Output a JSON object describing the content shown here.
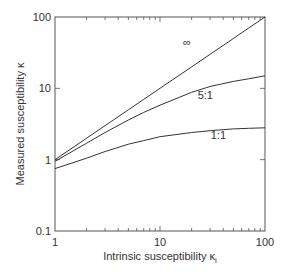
{
  "chart_data": {
    "type": "line",
    "title": "",
    "xlabel": "Intrinsic susceptibility κ",
    "xlabel_sub": "i",
    "ylabel": "Measured susceptibility κ",
    "xscale": "log",
    "yscale": "log",
    "xlim": [
      1,
      100
    ],
    "ylim": [
      0.1,
      100
    ],
    "x_ticks": [
      1,
      10,
      100
    ],
    "x_tick_labels": [
      "1",
      "10",
      "100"
    ],
    "y_ticks": [
      0.1,
      1,
      10,
      100
    ],
    "y_tick_labels": [
      "0.1",
      "1",
      "10",
      "100"
    ],
    "grid": false,
    "legend": "inline curve labels",
    "x": [
      1,
      2,
      3,
      5,
      7,
      10,
      20,
      30,
      50,
      70,
      100
    ],
    "series": [
      {
        "name": "∞",
        "label": "∞",
        "values": [
          1.0,
          2.0,
          3.0,
          5.0,
          7.0,
          10.0,
          20.0,
          30.0,
          50.0,
          70.0,
          100.0
        ]
      },
      {
        "name": "5:1",
        "label": "5:1",
        "values": [
          0.95,
          1.7,
          2.4,
          3.6,
          4.6,
          5.8,
          8.8,
          10.6,
          12.5,
          13.6,
          15.0
        ]
      },
      {
        "name": "1:1",
        "label": "1:1",
        "values": [
          0.75,
          1.05,
          1.3,
          1.65,
          1.85,
          2.1,
          2.4,
          2.55,
          2.7,
          2.75,
          2.8
        ]
      }
    ],
    "annotations": [
      {
        "text": "∞",
        "x": 18,
        "y": 45
      },
      {
        "text": "5:1",
        "x": 27,
        "y": 8
      },
      {
        "text": "1:1",
        "x": 36,
        "y": 2.2
      }
    ]
  }
}
